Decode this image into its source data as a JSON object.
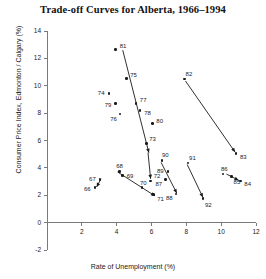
{
  "chart_data": {
    "type": "scatter",
    "title": "Trade-off Curves for Alberta, 1966–1994",
    "xlabel": "Rate of Unemployment (%)",
    "ylabel": "Consumer Price Index, Edmonton / Calgary (%)",
    "xlim": [
      0,
      12
    ],
    "ylim": [
      -2,
      14
    ],
    "xticks": [
      2,
      4,
      6,
      8,
      10,
      12
    ],
    "yticks": [
      -2,
      0,
      2,
      4,
      6,
      8,
      10,
      12,
      14
    ],
    "grid": false,
    "legend": "none",
    "marker_color": "#1a1a1a",
    "line_color": "#1a1a1a",
    "axis_color": "#7a7a7a",
    "points": [
      {
        "label": "66",
        "x": 2.75,
        "y": 2.55
      },
      {
        "label": "67",
        "x": 3.05,
        "y": 3.15
      },
      {
        "label": "68",
        "x": 4.15,
        "y": 3.75
      },
      {
        "label": "69",
        "x": 4.35,
        "y": 3.45
      },
      {
        "label": "70",
        "x": 5.45,
        "y": 2.55
      },
      {
        "label": "71",
        "x": 6.1,
        "y": 2.05
      },
      {
        "label": "72",
        "x": 5.95,
        "y": 3.05
      },
      {
        "label": "73",
        "x": 5.7,
        "y": 5.8
      },
      {
        "label": "74",
        "x": 3.55,
        "y": 9.45
      },
      {
        "label": "75",
        "x": 4.55,
        "y": 10.55
      },
      {
        "label": "76",
        "x": 4.2,
        "y": 7.95
      },
      {
        "label": "77",
        "x": 5.1,
        "y": 8.7
      },
      {
        "label": "78",
        "x": 5.35,
        "y": 8.2
      },
      {
        "label": "79",
        "x": 3.95,
        "y": 8.7
      },
      {
        "label": "80",
        "x": 6.05,
        "y": 7.25
      },
      {
        "label": "81",
        "x": 3.95,
        "y": 12.65
      },
      {
        "label": "82",
        "x": 7.9,
        "y": 10.5
      },
      {
        "label": "83",
        "x": 10.85,
        "y": 5.05
      },
      {
        "label": "84",
        "x": 11.1,
        "y": 3.05
      },
      {
        "label": "85",
        "x": 10.6,
        "y": 3.35
      },
      {
        "label": "86",
        "x": 10.1,
        "y": 3.55
      },
      {
        "label": "87",
        "x": 6.8,
        "y": 3.15
      },
      {
        "label": "88",
        "x": 7.4,
        "y": 2.1
      },
      {
        "label": "89",
        "x": 6.95,
        "y": 3.75
      },
      {
        "label": "90",
        "x": 6.6,
        "y": 4.55
      },
      {
        "label": "91",
        "x": 8.1,
        "y": 4.35
      },
      {
        "label": "92",
        "x": 8.95,
        "y": 1.75
      }
    ],
    "trend_lines": [
      {
        "name": "1974-1981",
        "x1": 4.35,
        "y1": 12.6,
        "x2": 5.85,
        "y2": 5.1,
        "arrow": true
      },
      {
        "name": "1966-1972",
        "x1": 4.05,
        "y1": 3.7,
        "x2": 6.2,
        "y2": 1.95,
        "arrow": true
      },
      {
        "name": "1972-arrow",
        "x1": 5.8,
        "y1": 5.1,
        "x2": 5.95,
        "y2": 3.2,
        "arrow": true
      },
      {
        "name": "1982-1983",
        "x1": 7.95,
        "y1": 10.35,
        "x2": 10.8,
        "y2": 5.15,
        "arrow": true
      },
      {
        "name": "1990-1988",
        "x1": 6.55,
        "y1": 4.4,
        "x2": 7.45,
        "y2": 2.15,
        "arrow": true
      },
      {
        "name": "1991-1992",
        "x1": 8.05,
        "y1": 4.25,
        "x2": 8.95,
        "y2": 1.85,
        "arrow": true
      },
      {
        "name": "1986-1884",
        "x1": 10.3,
        "y1": 3.55,
        "x2": 11.0,
        "y2": 3.1,
        "arrow": true
      },
      {
        "name": "1967-1966",
        "x1": 3.1,
        "y1": 3.2,
        "x2": 2.85,
        "y2": 2.6,
        "arrow": true
      }
    ]
  }
}
